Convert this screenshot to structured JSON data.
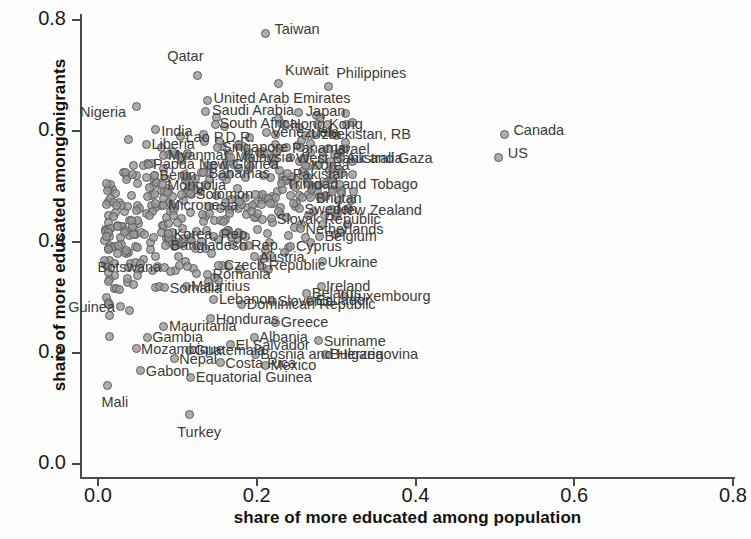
{
  "chart_data": {
    "type": "scatter",
    "title": "",
    "xlabel": "share of more educated among population",
    "ylabel": "share of more educated among migrants",
    "xlim": [
      0.0,
      0.8
    ],
    "ylim": [
      0.0,
      0.8
    ],
    "xticks": [
      "0.0",
      "0.2",
      "0.4",
      "0.6",
      "0.8"
    ],
    "yticks": [
      "0.0",
      "0.2",
      "0.4",
      "0.6",
      "0.8"
    ],
    "xtick_values": [
      0.0,
      0.2,
      0.4,
      0.6,
      0.8
    ],
    "ytick_values": [
      0.0,
      0.2,
      0.4,
      0.6,
      0.8
    ],
    "grid": false,
    "legend": null,
    "marker_color": "#969696",
    "marker_edge_color": "#5d5d5d",
    "labeled_points": [
      {
        "name": "Taiwan",
        "x": 0.211,
        "y": 0.775,
        "lx": 9,
        "ly": -7
      },
      {
        "name": "Qatar",
        "x": 0.125,
        "y": 0.7,
        "lx": -30,
        "ly": -22
      },
      {
        "name": "Kuwait",
        "x": 0.228,
        "y": 0.685,
        "lx": 6,
        "ly": -16
      },
      {
        "name": "Philippines",
        "x": 0.29,
        "y": 0.68,
        "lx": 8,
        "ly": -16
      },
      {
        "name": "United Arab Emirates",
        "x": 0.138,
        "y": 0.655,
        "lx": 6,
        "ly": -4
      },
      {
        "name": "Saudi Arabia",
        "x": 0.136,
        "y": 0.635,
        "lx": 6,
        "ly": -4
      },
      {
        "name": "Japan",
        "x": 0.253,
        "y": 0.633,
        "lx": 7,
        "ly": -4
      },
      {
        "name": "Nigeria",
        "x": 0.048,
        "y": 0.645,
        "lx": -56,
        "ly": 4
      },
      {
        "name": "South Africa",
        "x": 0.148,
        "y": 0.612,
        "lx": 4,
        "ly": -3
      },
      {
        "name": "Hong Kong",
        "x": 0.236,
        "y": 0.61,
        "lx": 5,
        "ly": -3
      },
      {
        "name": "India",
        "x": 0.072,
        "y": 0.602,
        "lx": 6,
        "ly": -1
      },
      {
        "name": "Venezuela",
        "x": 0.212,
        "y": 0.597,
        "lx": 5,
        "ly": -3
      },
      {
        "name": "Lao P.D.R.",
        "x": 0.104,
        "y": 0.59,
        "lx": 5,
        "ly": -2
      },
      {
        "name": "Uzbekistan, RB",
        "x": 0.262,
        "y": 0.592,
        "lx": 5,
        "ly": -3
      },
      {
        "name": "Liberia",
        "x": 0.061,
        "y": 0.576,
        "lx": 5,
        "ly": -2
      },
      {
        "name": "Singapore",
        "x": 0.15,
        "y": 0.571,
        "lx": 5,
        "ly": -2
      },
      {
        "name": "Panama",
        "x": 0.238,
        "y": 0.57,
        "lx": 5,
        "ly": -2
      },
      {
        "name": "Israel",
        "x": 0.29,
        "y": 0.568,
        "lx": 6,
        "ly": -2
      },
      {
        "name": "Myanmar",
        "x": 0.082,
        "y": 0.556,
        "lx": 5,
        "ly": -2
      },
      {
        "name": "Malaysia",
        "x": 0.167,
        "y": 0.553,
        "lx": 5,
        "ly": -2
      },
      {
        "name": "Australia",
        "x": 0.305,
        "y": 0.551,
        "lx": 6,
        "ly": -2
      },
      {
        "name": "West Bank and Gaza",
        "x": 0.243,
        "y": 0.552,
        "lx": 5,
        "ly": -2
      },
      {
        "name": "Papua New Guinea",
        "x": 0.063,
        "y": 0.54,
        "lx": 5,
        "ly": -2
      },
      {
        "name": "Korea",
        "x": 0.262,
        "y": 0.538,
        "lx": 5,
        "ly": -2
      },
      {
        "name": "Bahamas",
        "x": 0.133,
        "y": 0.525,
        "lx": 5,
        "ly": -2
      },
      {
        "name": "Pakistan",
        "x": 0.239,
        "y": 0.523,
        "lx": 5,
        "ly": -2
      },
      {
        "name": "Benin",
        "x": 0.071,
        "y": 0.52,
        "lx": 5,
        "ly": -2
      },
      {
        "name": "Trinidad and Tobago",
        "x": 0.231,
        "y": 0.505,
        "lx": 5,
        "ly": -2
      },
      {
        "name": "Mongolia",
        "x": 0.081,
        "y": 0.503,
        "lx": 5,
        "ly": -2
      },
      {
        "name": "Solomon",
        "x": 0.117,
        "y": 0.487,
        "lx": 5,
        "ly": -2
      },
      {
        "name": "Bhutan",
        "x": 0.268,
        "y": 0.48,
        "lx": 5,
        "ly": -2
      },
      {
        "name": "Micronesia",
        "x": 0.082,
        "y": 0.466,
        "lx": 5,
        "ly": -2
      },
      {
        "name": "Sweden",
        "x": 0.254,
        "y": 0.46,
        "lx": 5,
        "ly": -2
      },
      {
        "name": "New Zealand",
        "x": 0.294,
        "y": 0.458,
        "lx": 5,
        "ly": -2
      },
      {
        "name": "Slovak Republic",
        "x": 0.219,
        "y": 0.442,
        "lx": 5,
        "ly": -2
      },
      {
        "name": "Netherlands",
        "x": 0.255,
        "y": 0.424,
        "lx": 5,
        "ly": -2
      },
      {
        "name": "Belgium",
        "x": 0.279,
        "y": 0.41,
        "lx": 5,
        "ly": -2
      },
      {
        "name": "Korea, Rep.",
        "x": 0.089,
        "y": 0.415,
        "lx": 5,
        "ly": -2
      },
      {
        "name": "Bangladesh Rep.",
        "x": 0.085,
        "y": 0.394,
        "lx": 5,
        "ly": -2
      },
      {
        "name": "Cyprus",
        "x": 0.243,
        "y": 0.392,
        "lx": 5,
        "ly": -2
      },
      {
        "name": "Austria",
        "x": 0.197,
        "y": 0.373,
        "lx": 5,
        "ly": -2
      },
      {
        "name": "Czech Republic",
        "x": 0.152,
        "y": 0.358,
        "lx": 5,
        "ly": -2
      },
      {
        "name": "Botswana",
        "x": 0.075,
        "y": 0.355,
        "lx": -60,
        "ly": -2
      },
      {
        "name": "Romania",
        "x": 0.138,
        "y": 0.342,
        "lx": 5,
        "ly": -2
      },
      {
        "name": "Ukraine",
        "x": 0.283,
        "y": 0.364,
        "lx": 5,
        "ly": -2
      },
      {
        "name": "Ireland",
        "x": 0.281,
        "y": 0.32,
        "lx": 5,
        "ly": -2
      },
      {
        "name": "Mauritius",
        "x": 0.111,
        "y": 0.32,
        "lx": 5,
        "ly": -2
      },
      {
        "name": "Somalia",
        "x": 0.084,
        "y": 0.318,
        "lx": 5,
        "ly": -2
      },
      {
        "name": "Belarus",
        "x": 0.263,
        "y": 0.308,
        "lx": 5,
        "ly": -2
      },
      {
        "name": "Luxembourg",
        "x": 0.311,
        "y": 0.302,
        "lx": 5,
        "ly": -2
      },
      {
        "name": "Ecuador",
        "x": 0.268,
        "y": 0.295,
        "lx": 5,
        "ly": -2
      },
      {
        "name": "Lebanon",
        "x": 0.146,
        "y": 0.297,
        "lx": 5,
        "ly": -2
      },
      {
        "name": "Slovenia",
        "x": 0.22,
        "y": 0.293,
        "lx": 5,
        "ly": -2
      },
      {
        "name": "Dominican Republic",
        "x": 0.181,
        "y": 0.288,
        "lx": 5,
        "ly": -2
      },
      {
        "name": "Guinea",
        "x": 0.028,
        "y": 0.283,
        "lx": -52,
        "ly": -2
      },
      {
        "name": "Honduras",
        "x": 0.142,
        "y": 0.262,
        "lx": 5,
        "ly": -2
      },
      {
        "name": "Greece",
        "x": 0.224,
        "y": 0.255,
        "lx": 5,
        "ly": -2
      },
      {
        "name": "Mauritania",
        "x": 0.083,
        "y": 0.248,
        "lx": 5,
        "ly": -2
      },
      {
        "name": "Gambia",
        "x": 0.062,
        "y": 0.228,
        "lx": 5,
        "ly": -2
      },
      {
        "name": "Albania",
        "x": 0.197,
        "y": 0.228,
        "lx": 5,
        "ly": -2
      },
      {
        "name": "Suriname",
        "x": 0.278,
        "y": 0.222,
        "lx": 5,
        "ly": -2
      },
      {
        "name": "El Salvador",
        "x": 0.167,
        "y": 0.215,
        "lx": 5,
        "ly": -2
      },
      {
        "name": "Mozambique",
        "x": 0.048,
        "y": 0.208,
        "lx": 5,
        "ly": -2
      },
      {
        "name": "Guatemala",
        "x": 0.115,
        "y": 0.205,
        "lx": 5,
        "ly": -2
      },
      {
        "name": "Bosnia and Herzegovina",
        "x": 0.198,
        "y": 0.198,
        "lx": 5,
        "ly": -2
      },
      {
        "name": "Bulgaria",
        "x": 0.286,
        "y": 0.198,
        "lx": 5,
        "ly": -2
      },
      {
        "name": "Nepal",
        "x": 0.096,
        "y": 0.19,
        "lx": 5,
        "ly": -2
      },
      {
        "name": "Costa Rica",
        "x": 0.154,
        "y": 0.182,
        "lx": 5,
        "ly": -2
      },
      {
        "name": "Mexico",
        "x": 0.211,
        "y": 0.178,
        "lx": 5,
        "ly": -2
      },
      {
        "name": "Gabon",
        "x": 0.054,
        "y": 0.168,
        "lx": 5,
        "ly": -2
      },
      {
        "name": "Equatorial Guinea",
        "x": 0.117,
        "y": 0.156,
        "lx": 5,
        "ly": -2
      },
      {
        "name": "Mali",
        "x": 0.012,
        "y": 0.141,
        "lx": -6,
        "ly": 14
      },
      {
        "name": "Turkey",
        "x": 0.115,
        "y": 0.09,
        "lx": -12,
        "ly": 16
      },
      {
        "name": "Canada",
        "x": 0.512,
        "y": 0.594,
        "lx": 9,
        "ly": -6
      },
      {
        "name": "US",
        "x": 0.505,
        "y": 0.553,
        "lx": 9,
        "ly": -6
      }
    ],
    "cloud_seed": 17,
    "cloud_count": 430,
    "cloud_note": "dense unlabeled country cloud, x 0.005-0.33, y 0.08-0.62"
  }
}
